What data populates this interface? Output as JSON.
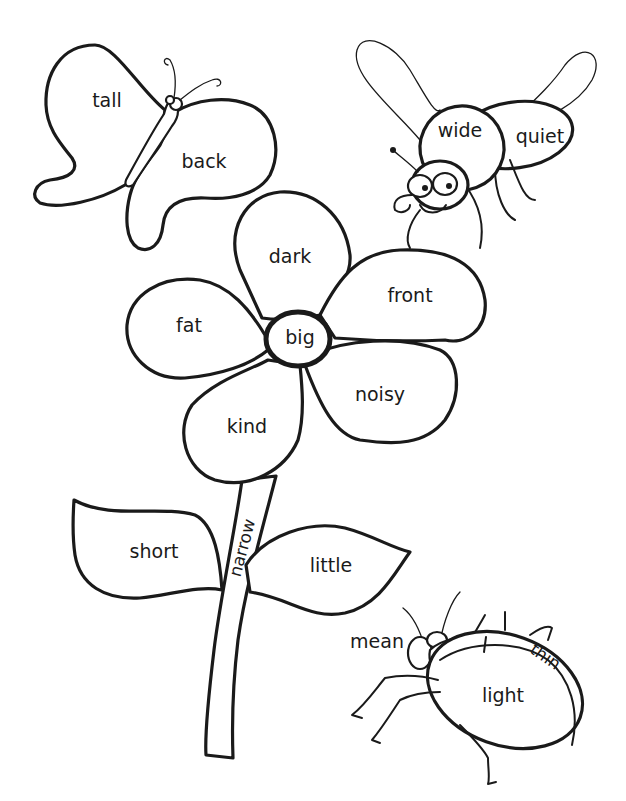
{
  "page": {
    "type": "coloring-worksheet"
  },
  "butterfly": {
    "upper_wing": "tall",
    "lower_wing": "back"
  },
  "bee": {
    "front_body": "wide",
    "back_body": "quiet"
  },
  "flower": {
    "center": "big",
    "petals": {
      "top": "dark",
      "right": "front",
      "left": "fat",
      "bottom_right": "noisy",
      "bottom_left": "kind"
    },
    "stem": "narrow",
    "left_leaf": "short",
    "right_leaf": "little"
  },
  "beetle": {
    "head_label": "mean",
    "shell_stripe": "thin",
    "shell": "light"
  },
  "colors": {
    "ink": "#1a1a1a",
    "paper": "#ffffff"
  }
}
